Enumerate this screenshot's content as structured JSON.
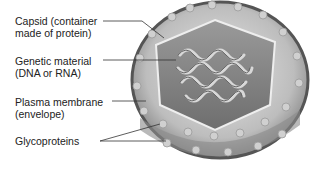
{
  "diagram": {
    "type": "labeled-illustration",
    "labels": [
      {
        "id": "capsid",
        "line1": "Capsid (container",
        "line2": "made of protein)"
      },
      {
        "id": "genetic",
        "line1": "Genetic material",
        "line2": "(DNA or RNA)"
      },
      {
        "id": "membrane",
        "line1": "Plasma membrane",
        "line2": "(envelope)"
      },
      {
        "id": "glyco",
        "line1": "Glycoproteins",
        "line2": ""
      }
    ]
  }
}
